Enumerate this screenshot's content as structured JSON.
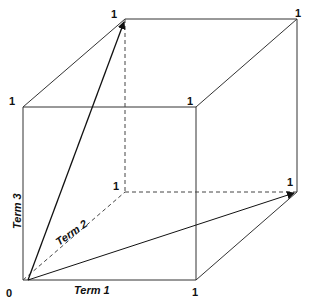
{
  "diagram": {
    "type": "3d-unit-cube-vector-space",
    "axes": [
      {
        "id": "term1",
        "label": "Term 1"
      },
      {
        "id": "term2",
        "label": "Term 2"
      },
      {
        "id": "term3",
        "label": "Term 3"
      }
    ],
    "origin_label": "0",
    "vertex_labels": {
      "front_top_left": "1",
      "back_top_left": "1",
      "back_top_right": "1",
      "front_top_right": "1",
      "back_bottom_left": "1",
      "back_bottom_right": "1",
      "front_bottom_right": "1"
    },
    "vectors": [
      {
        "from": "0",
        "to": "back_top_left",
        "style": "solid-arrow"
      },
      {
        "from": "0",
        "to": "back_bottom_right",
        "style": "solid-arrow"
      }
    ],
    "colors": {
      "line": "#222222",
      "background": "#ffffff"
    }
  }
}
